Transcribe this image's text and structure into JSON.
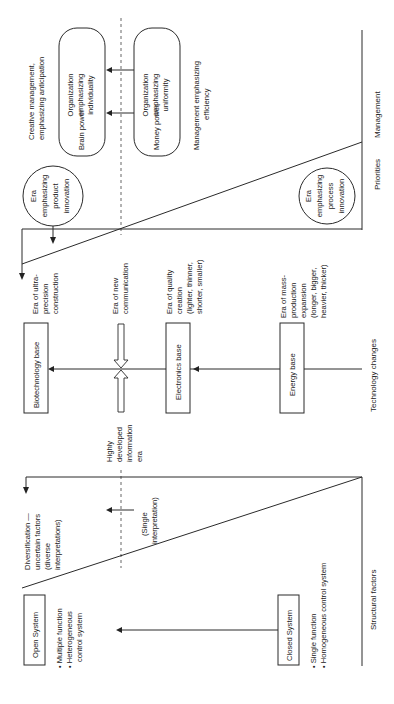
{
  "diagram": {
    "orientation": "rotated 90 degrees counter-clockwise",
    "axes": {
      "management": "Management",
      "priorities": "Priorities",
      "technology": "Technology changes",
      "structural": "Structural factors"
    },
    "management_section": {
      "creative_label_1": "Creative management,",
      "creative_label_2": "emphasizing anticipation",
      "efficiency_label_1": "Management emphasizing",
      "efficiency_label_2": "efficiency",
      "brain_box": {
        "left": "Brain power",
        "right_1": "Organization",
        "right_2": "emphasizing",
        "right_3": "individuality"
      },
      "money_box": {
        "left": "Money power",
        "right_1": "Organization",
        "right_2": "emphasizing",
        "right_3": "uniformity"
      }
    },
    "priorities_section": {
      "product_circle": [
        "Era",
        "emphasizing",
        "product",
        "innovation"
      ],
      "process_circle": [
        "Era",
        "emphasizing",
        "process",
        "innovation"
      ]
    },
    "technology_section": {
      "biotech": "Biotechnology base",
      "electronics": "Electronics base",
      "energy": "Energy base",
      "ultra_precision": [
        "Era of ultra-",
        "precision",
        "construction"
      ],
      "new_communication": [
        "Era of new",
        "communication"
      ],
      "quality_creation": [
        "Era of quality",
        "creation",
        "(lighter, thinner,",
        "shorter, smaller)"
      ],
      "mass_production": [
        "Era of mass-",
        "production",
        "expansion",
        "(longer, bigger,",
        "heavier, thicker)"
      ],
      "info_era": [
        "Highly",
        "developed",
        "information",
        "era"
      ]
    },
    "structural_section": {
      "diversification": [
        "Diversification —",
        "uncertain factors",
        "(diverse",
        "interpretations)"
      ],
      "single_interp": [
        "(Single",
        "interpretation)"
      ],
      "open_system": "Open System",
      "open_bullets": [
        "• Multiple function",
        "• Heterogeneous",
        "control system"
      ],
      "closed_system": "Closed System",
      "closed_bullets": [
        "• Single function",
        "• Homogeneous control system"
      ]
    }
  }
}
